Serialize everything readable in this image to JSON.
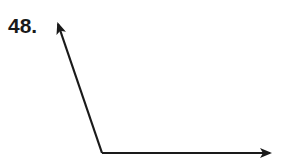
{
  "problem": {
    "number_label": "48."
  },
  "diagram": {
    "type": "angle",
    "vertex": [
      102,
      153
    ],
    "ray_1_end": [
      57,
      22
    ],
    "ray_2_end": [
      272,
      153
    ],
    "stroke_color": "#1a1a1a"
  }
}
